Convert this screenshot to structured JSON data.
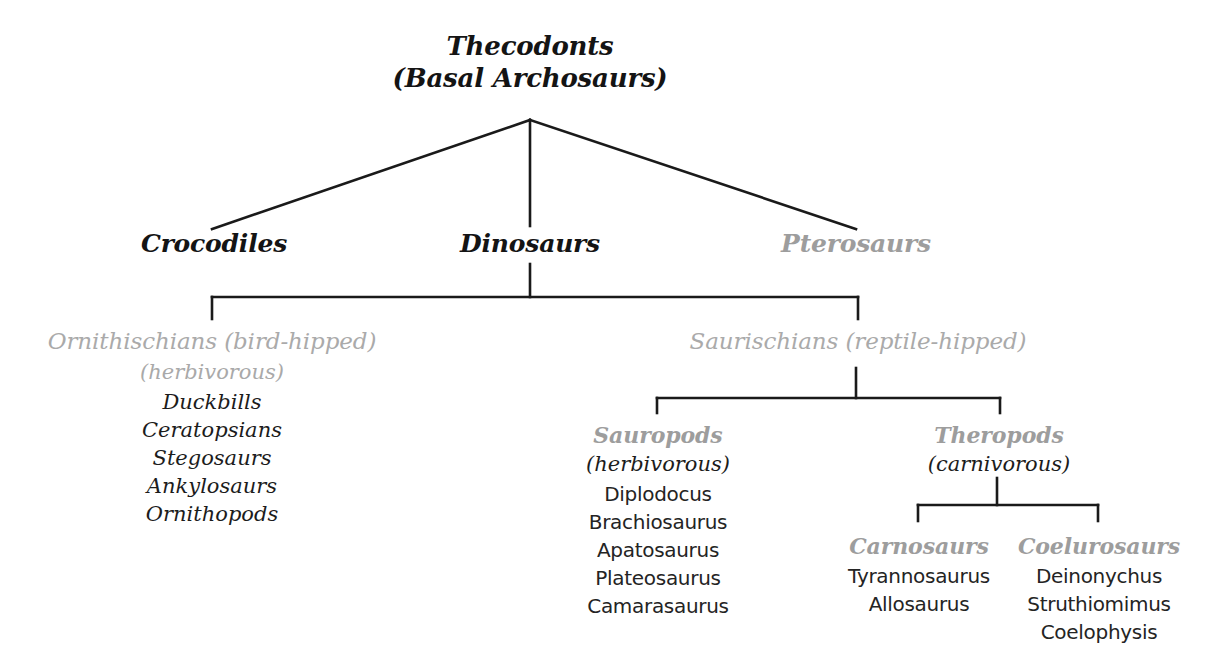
{
  "diagram": {
    "type": "cladogram",
    "background": "#ffffff",
    "colors": {
      "dark_text": "#141414",
      "body_text": "#1c1c1c",
      "gray_heading": "#9d9d9d",
      "gray_light": "#aaaaaa",
      "line": "#1a1a1a"
    }
  },
  "root": {
    "line1": "Thecodonts",
    "line2": "(Basal Archosaurs)"
  },
  "level1": {
    "crocodiles": "Crocodiles",
    "dinosaurs": "Dinosaurs",
    "pterosaurs": "Pterosaurs"
  },
  "ornithischians": {
    "heading": "Ornithischians (bird-hipped)",
    "diet": "(herbivorous)",
    "taxa": [
      "Duckbills",
      "Ceratopsians",
      "Stegosaurs",
      "Ankylosaurs",
      "Ornithopods"
    ]
  },
  "saurischians": {
    "heading": "Saurischians (reptile-hipped)"
  },
  "sauropods": {
    "heading": "Sauropods",
    "diet": "(herbivorous)",
    "taxa": [
      "Diplodocus",
      "Brachiosaurus",
      "Apatosaurus",
      "Plateosaurus",
      "Camarasaurus"
    ]
  },
  "theropods": {
    "heading": "Theropods",
    "diet": "(carnivorous)"
  },
  "carnosaurs": {
    "heading": "Carnosaurs",
    "taxa": [
      "Tyrannosaurus",
      "Allosaurus"
    ]
  },
  "coelurosaurs": {
    "heading": "Coelurosaurs",
    "taxa": [
      "Deinonychus",
      "Struthiomimus",
      "Coelophysis"
    ]
  }
}
